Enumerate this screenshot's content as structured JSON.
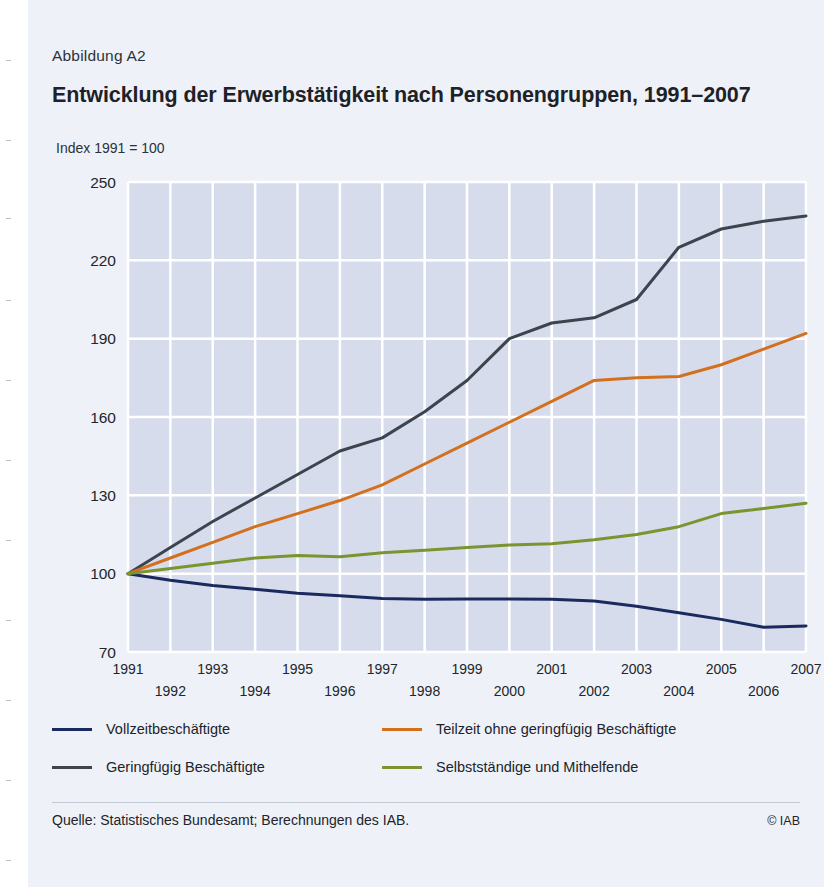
{
  "figure": {
    "number": "Abbildung A2",
    "title": "Entwicklung der Erwerbstätigkeit nach Personengruppen, 1991–2007",
    "index_note": "Index 1991 = 100",
    "source": "Quelle: Statistisches Bundesamt; Berechnungen des IAB.",
    "copyright": "© IAB"
  },
  "colors": {
    "card_background": "#eef1f7",
    "plot_background": "#d6dcec",
    "gridline": "#ffffff",
    "axis_text": "#22262c",
    "vollzeit": "#1b2a5e",
    "geringfuegig": "#3c444e",
    "teilzeit": "#d2701e",
    "selbststaendige": "#7a9430"
  },
  "chart_data": {
    "type": "line",
    "title": "Entwicklung der Erwerbstätigkeit nach Personengruppen, 1991–2007",
    "subtitle": "Index 1991 = 100",
    "xlabel": "",
    "ylabel": "Index 1991 = 100",
    "xlim": [
      1991,
      2007
    ],
    "ylim": [
      70,
      250
    ],
    "yticks": [
      70,
      100,
      130,
      160,
      190,
      220,
      250
    ],
    "grid": true,
    "legend_position": "below",
    "x": [
      1991,
      1992,
      1993,
      1994,
      1995,
      1996,
      1997,
      1998,
      1999,
      2000,
      2001,
      2002,
      2003,
      2004,
      2005,
      2006,
      2007
    ],
    "xtick_labels_top": [
      "1991",
      "1993",
      "1995",
      "1997",
      "1999",
      "2001",
      "2003",
      "2005",
      "2007"
    ],
    "xtick_labels_bottom": [
      "1992",
      "1994",
      "1996",
      "1998",
      "2000",
      "2002",
      "2004",
      "2006"
    ],
    "series": [
      {
        "name": "Vollzeitbeschäftigte",
        "color": "#1b2a5e",
        "values": [
          100,
          97.5,
          95.5,
          94,
          92.5,
          91.5,
          90.5,
          90.2,
          90.3,
          90.3,
          90.2,
          89.5,
          87.5,
          85,
          82.5,
          79.5,
          80
        ]
      },
      {
        "name": "Geringfügig Beschäftigte",
        "color": "#3c444e",
        "values": [
          100,
          110,
          120,
          129,
          138,
          147,
          152,
          162,
          174,
          190,
          196,
          198,
          205,
          225,
          232,
          235,
          237
        ]
      },
      {
        "name": "Teilzeit ohne geringfügig Beschäftigte",
        "color": "#d2701e",
        "values": [
          100,
          106,
          112,
          118,
          123,
          128,
          134,
          142,
          150,
          158,
          166,
          174,
          175,
          175.5,
          180,
          186,
          192
        ]
      },
      {
        "name": "Selbstständige und Mithelfende",
        "color": "#7a9430",
        "values": [
          100,
          102,
          104,
          106,
          107,
          106.5,
          108,
          109,
          110,
          111,
          111.5,
          113,
          115,
          118,
          123,
          125,
          127
        ]
      }
    ]
  },
  "legend": {
    "entries": [
      {
        "label": "Vollzeitbeschäftigte",
        "color": "#1b2a5e",
        "row": 0,
        "col": 0
      },
      {
        "label": "Teilzeit ohne geringfügig Beschäftigte",
        "color": "#d2701e",
        "row": 0,
        "col": 1
      },
      {
        "label": "Geringfügig Beschäftigte",
        "color": "#3c444e",
        "row": 1,
        "col": 0
      },
      {
        "label": "Selbstständige und Mithelfende",
        "color": "#7a9430",
        "row": 1,
        "col": 1
      }
    ]
  }
}
